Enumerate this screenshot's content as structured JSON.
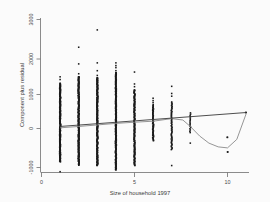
{
  "chart_data": {
    "type": "scatter",
    "title": "",
    "xlabel": "Size of household 1997",
    "ylabel": "Component plus residual",
    "xlim": [
      -0.2,
      11.8
    ],
    "ylim": [
      -1450,
      3180
    ],
    "xticks": [
      0,
      5,
      10
    ],
    "xticklabels": [
      "0",
      "5",
      "10"
    ],
    "yticks": [
      -1000,
      0,
      1000,
      2000,
      3000
    ],
    "yticklabels": [
      "-1000",
      "0",
      "1000",
      "2000",
      "3000"
    ],
    "grid": false,
    "legend": "none",
    "series": [
      {
        "name": "Component plus residual",
        "type": "scatter",
        "marker": "filled-square",
        "columns": [
          {
            "x": 1,
            "n": 210,
            "ymin": -980,
            "ymax": 1520,
            "dense_low": -980,
            "dense_high": 1320,
            "outliers": [
              1520,
              1440,
              1330,
              -1270
            ]
          },
          {
            "x": 2,
            "n": 240,
            "ymin": -1080,
            "ymax": 1900,
            "dense_low": -1080,
            "dense_high": 1520,
            "outliers": [
              2390,
              1900,
              1610,
              1520
            ]
          },
          {
            "x": 3,
            "n": 235,
            "ymin": -1090,
            "ymax": 1930,
            "dense_low": -1090,
            "dense_high": 1490,
            "outliers": [
              2900,
              1930,
              1700,
              1560,
              1490
            ]
          },
          {
            "x": 4,
            "n": 225,
            "ymin": -1220,
            "ymax": 1930,
            "dense_low": -1220,
            "dense_high": 1640,
            "outliers": [
              1930,
              1850,
              1790,
              1700,
              1640
            ]
          },
          {
            "x": 5,
            "n": 150,
            "ymin": -1090,
            "ymax": 1660,
            "dense_low": -1090,
            "dense_high": 1130,
            "outliers": [
              1660,
              1310,
              1230,
              1130
            ]
          },
          {
            "x": 6,
            "n": 60,
            "ymin": -360,
            "ymax": 890,
            "dense_low": -360,
            "dense_high": 700,
            "outliers": [
              890,
              820,
              760
            ]
          },
          {
            "x": 7,
            "n": 55,
            "ymin": -1090,
            "ymax": 1240,
            "dense_low": -620,
            "dense_high": 780,
            "outliers": [
              1240,
              1030,
              950,
              -1090
            ]
          },
          {
            "x": 8,
            "n": 16,
            "ymin": -430,
            "ymax": 460,
            "dense_low": -120,
            "dense_high": 460,
            "outliers": [
              -430
            ]
          },
          {
            "x": 10,
            "n": 2,
            "ymin": -690,
            "ymax": -260,
            "dense_low": -690,
            "dense_high": -260,
            "outliers": [
              -260,
              -690
            ]
          },
          {
            "x": 11,
            "n": 1,
            "ymin": 470,
            "ymax": 470,
            "dense_low": 470,
            "dense_high": 470,
            "outliers": [
              470
            ]
          }
        ]
      },
      {
        "name": "Linear fit",
        "type": "line",
        "x": [
          1,
          11
        ],
        "y": [
          60,
          470
        ]
      },
      {
        "name": "Lowess smoother",
        "type": "line",
        "x": [
          1,
          2,
          3,
          4,
          5,
          6,
          7,
          7.6,
          8,
          8.5,
          9,
          9.5,
          10,
          10.5,
          11
        ],
        "y": [
          20,
          60,
          105,
          150,
          185,
          215,
          290,
          250,
          60,
          -220,
          -430,
          -540,
          -570,
          -320,
          430
        ]
      }
    ]
  }
}
